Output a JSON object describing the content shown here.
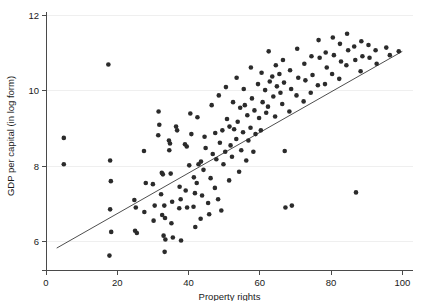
{
  "chart_data": {
    "type": "scatter",
    "title": "",
    "xlabel": "Property rights",
    "ylabel": "GDP per capital (in log form)",
    "xlim": [
      0,
      103
    ],
    "ylim": [
      5.45,
      12.15
    ],
    "xticks": [
      0,
      20,
      40,
      60,
      80,
      100
    ],
    "xticklabels": [
      "0",
      "20",
      "40",
      "60",
      "80",
      "100"
    ],
    "yticks": [
      6,
      8,
      10,
      12
    ],
    "yticklabels": [
      "6",
      "8",
      "10",
      "12"
    ],
    "grid": "horizontal-light",
    "legend": "none",
    "marker_color": "#2b2b2b",
    "line_color": "#3a3a3a",
    "fit_line": {
      "name": "linear fit",
      "x": [
        3,
        100
      ],
      "y": [
        5.82,
        11.05
      ]
    },
    "series": [
      {
        "name": "Countries",
        "points": [
          [
            5.0,
            8.75
          ],
          [
            5.0,
            8.05
          ],
          [
            17.5,
            10.7
          ],
          [
            18.0,
            8.15
          ],
          [
            18.2,
            7.6
          ],
          [
            18.0,
            6.85
          ],
          [
            18.3,
            6.25
          ],
          [
            17.8,
            5.62
          ],
          [
            24.8,
            7.1
          ],
          [
            25.2,
            6.9
          ],
          [
            25.0,
            6.28
          ],
          [
            25.5,
            6.22
          ],
          [
            27.5,
            8.4
          ],
          [
            28.0,
            7.55
          ],
          [
            27.6,
            6.78
          ],
          [
            30.0,
            7.52
          ],
          [
            30.5,
            6.95
          ],
          [
            30.2,
            6.55
          ],
          [
            31.5,
            8.82
          ],
          [
            31.8,
            9.1
          ],
          [
            31.6,
            9.45
          ],
          [
            32.5,
            7.82
          ],
          [
            32.8,
            7.78
          ],
          [
            32.3,
            7.25
          ],
          [
            32.6,
            6.7
          ],
          [
            33.2,
            6.95
          ],
          [
            33.4,
            6.62
          ],
          [
            33.0,
            6.15
          ],
          [
            33.5,
            6.05
          ],
          [
            33.3,
            5.72
          ],
          [
            34.5,
            8.68
          ],
          [
            34.8,
            8.6
          ],
          [
            34.6,
            8.42
          ],
          [
            35.0,
            7.8
          ],
          [
            35.4,
            7.05
          ],
          [
            35.2,
            6.48
          ],
          [
            35.6,
            6.1
          ],
          [
            36.5,
            9.05
          ],
          [
            36.8,
            8.95
          ],
          [
            37.5,
            7.45
          ],
          [
            37.8,
            7.12
          ],
          [
            37.4,
            6.88
          ],
          [
            37.9,
            6.02
          ],
          [
            39.0,
            8.58
          ],
          [
            39.5,
            8.52
          ],
          [
            39.2,
            7.35
          ],
          [
            39.6,
            6.9
          ],
          [
            40.5,
            9.4
          ],
          [
            40.8,
            8.85
          ],
          [
            40.2,
            8.02
          ],
          [
            41.5,
            7.7
          ],
          [
            41.8,
            7.28
          ],
          [
            41.4,
            6.92
          ],
          [
            41.9,
            6.38
          ],
          [
            42.5,
            9.3
          ],
          [
            42.8,
            8.05
          ],
          [
            42.3,
            7.55
          ],
          [
            43.5,
            8.12
          ],
          [
            43.8,
            7.22
          ],
          [
            43.4,
            6.6
          ],
          [
            44.5,
            8.78
          ],
          [
            44.8,
            8.48
          ],
          [
            44.2,
            7.9
          ],
          [
            45.5,
            7.02
          ],
          [
            45.8,
            6.72
          ],
          [
            46.5,
            9.62
          ],
          [
            46.8,
            8.32
          ],
          [
            46.2,
            7.68
          ],
          [
            47.5,
            8.88
          ],
          [
            47.8,
            8.18
          ],
          [
            47.4,
            7.42
          ],
          [
            48.5,
            9.88
          ],
          [
            48.8,
            8.62
          ],
          [
            48.3,
            7.12
          ],
          [
            49.5,
            8.95
          ],
          [
            49.8,
            8.05
          ],
          [
            49.2,
            6.82
          ],
          [
            50.5,
            10.1
          ],
          [
            50.8,
            9.25
          ],
          [
            50.3,
            8.38
          ],
          [
            51.5,
            9.05
          ],
          [
            51.8,
            8.55
          ],
          [
            51.4,
            7.62
          ],
          [
            52.5,
            9.7
          ],
          [
            52.8,
            8.98
          ],
          [
            52.2,
            8.25
          ],
          [
            53.5,
            10.35
          ],
          [
            53.8,
            9.18
          ],
          [
            53.4,
            8.72
          ],
          [
            54.5,
            9.55
          ],
          [
            54.8,
            8.42
          ],
          [
            54.2,
            7.85
          ],
          [
            55.5,
            10.05
          ],
          [
            55.8,
            9.62
          ],
          [
            55.3,
            8.9
          ],
          [
            56.5,
            9.35
          ],
          [
            56.8,
            8.68
          ],
          [
            56.2,
            8.15
          ],
          [
            57.5,
            10.62
          ],
          [
            57.8,
            9.8
          ],
          [
            57.4,
            9.02
          ],
          [
            58.5,
            9.48
          ],
          [
            58.8,
            8.85
          ],
          [
            58.2,
            8.38
          ],
          [
            59.5,
            10.18
          ],
          [
            59.8,
            9.28
          ],
          [
            60.5,
            10.48
          ],
          [
            60.8,
            9.7
          ],
          [
            60.3,
            8.95
          ],
          [
            61.5,
            10.02
          ],
          [
            61.8,
            9.42
          ],
          [
            62.5,
            11.05
          ],
          [
            62.8,
            10.25
          ],
          [
            62.3,
            9.58
          ],
          [
            63.5,
            10.38
          ],
          [
            63.8,
            9.85
          ],
          [
            64.5,
            10.68
          ],
          [
            64.8,
            10.12
          ],
          [
            64.3,
            9.32
          ],
          [
            65.5,
            10.45
          ],
          [
            65.8,
            9.95
          ],
          [
            66.5,
            10.82
          ],
          [
            66.8,
            10.22
          ],
          [
            66.3,
            9.65
          ],
          [
            67.0,
            8.4
          ],
          [
            67.2,
            6.9
          ],
          [
            69.0,
            6.95
          ],
          [
            68.5,
            10.55
          ],
          [
            68.8,
            10.05
          ],
          [
            68.3,
            9.45
          ],
          [
            70.5,
            11.12
          ],
          [
            70.8,
            10.35
          ],
          [
            70.3,
            9.88
          ],
          [
            72.5,
            10.72
          ],
          [
            72.8,
            10.28
          ],
          [
            72.3,
            9.72
          ],
          [
            74.5,
            10.92
          ],
          [
            74.8,
            10.42
          ],
          [
            74.3,
            9.95
          ],
          [
            76.5,
            11.35
          ],
          [
            76.8,
            10.88
          ],
          [
            76.3,
            10.15
          ],
          [
            78.5,
            11.02
          ],
          [
            78.8,
            10.62
          ],
          [
            78.3,
            10.18
          ],
          [
            80.5,
            11.42
          ],
          [
            80.8,
            10.95
          ],
          [
            80.3,
            10.45
          ],
          [
            82.5,
            11.25
          ],
          [
            82.8,
            10.78
          ],
          [
            82.3,
            10.32
          ],
          [
            84.5,
            11.52
          ],
          [
            84.8,
            11.08
          ],
          [
            84.3,
            10.68
          ],
          [
            86.5,
            11.18
          ],
          [
            86.8,
            10.82
          ],
          [
            87.0,
            7.3
          ],
          [
            88.5,
            11.32
          ],
          [
            88.8,
            10.92
          ],
          [
            88.3,
            10.52
          ],
          [
            90.5,
            11.22
          ],
          [
            90.8,
            10.88
          ],
          [
            92.5,
            11.08
          ],
          [
            92.8,
            10.72
          ],
          [
            95.5,
            11.15
          ],
          [
            96.5,
            10.95
          ],
          [
            99.0,
            11.05
          ]
        ]
      }
    ]
  },
  "axis": {
    "x_title": "Property rights",
    "y_title": "GDP per capital (in log form)"
  }
}
